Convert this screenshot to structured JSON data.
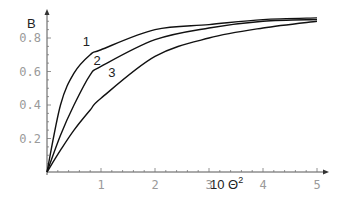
{
  "chart_data": {
    "type": "line",
    "title": "",
    "xlabel": "10 Θ²",
    "xlabel_base": "10 Θ",
    "xlabel_sup": "2",
    "ylabel": "B",
    "xlim": [
      0,
      5
    ],
    "ylim": [
      0,
      0.95
    ],
    "grid": false,
    "legend": "inline curve labels",
    "x_ticks": [
      1,
      2,
      3,
      4,
      5
    ],
    "x_tick_labels": [
      "1",
      "2",
      "3",
      "4",
      "5"
    ],
    "y_ticks": [
      0.2,
      0.4,
      0.6,
      0.8
    ],
    "y_tick_labels": [
      "0.2",
      "0.4",
      "0.6",
      "0.8"
    ],
    "x": [
      0,
      0.25,
      0.5,
      0.8,
      1,
      2,
      3,
      4,
      5
    ],
    "series": [
      {
        "name": "1",
        "values": [
          0,
          0.4,
          0.59,
          0.7,
          0.73,
          0.85,
          0.88,
          0.91,
          0.92
        ]
      },
      {
        "name": "2",
        "values": [
          0,
          0.22,
          0.4,
          0.58,
          0.63,
          0.79,
          0.86,
          0.9,
          0.91
        ]
      },
      {
        "name": "3",
        "values": [
          0,
          0.13,
          0.25,
          0.37,
          0.44,
          0.69,
          0.8,
          0.86,
          0.9
        ]
      }
    ],
    "annotations": [
      {
        "text": "1",
        "x": 0.73,
        "y": 0.75
      },
      {
        "text": "2",
        "x": 0.93,
        "y": 0.64
      },
      {
        "text": "3",
        "x": 1.2,
        "y": 0.57
      }
    ]
  }
}
